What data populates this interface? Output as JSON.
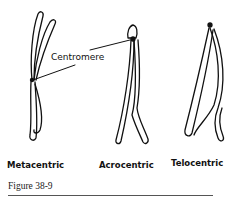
{
  "labels": {
    "centromere": "Centromere",
    "types": [
      "Metacentric",
      "Acrocentric",
      "Telocentric"
    ]
  },
  "caption": "Figure 38-9"
}
